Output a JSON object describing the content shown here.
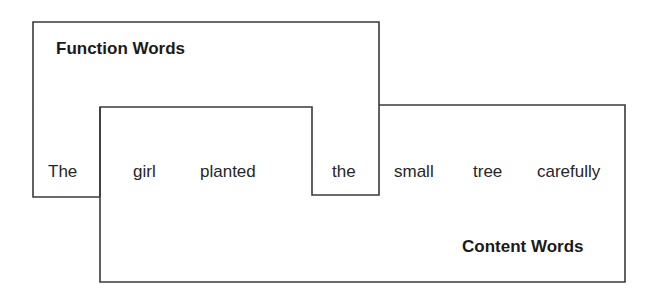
{
  "diagram": {
    "function_region": {
      "label": "Function Words",
      "words": [
        "The",
        "the"
      ]
    },
    "content_region": {
      "label": "Content Words",
      "words": [
        "girl",
        "planted",
        "small",
        "tree",
        "carefully"
      ]
    },
    "sentence": {
      "words": [
        {
          "text": "The",
          "category": "function"
        },
        {
          "text": "girl",
          "category": "content"
        },
        {
          "text": "planted",
          "category": "content"
        },
        {
          "text": "the",
          "category": "function"
        },
        {
          "text": "small",
          "category": "content"
        },
        {
          "text": "tree",
          "category": "content"
        },
        {
          "text": "carefully",
          "category": "content"
        }
      ]
    },
    "colors": {
      "outline": "#3a3a3a",
      "text": "#1f1f1f",
      "background": "#ffffff"
    }
  }
}
